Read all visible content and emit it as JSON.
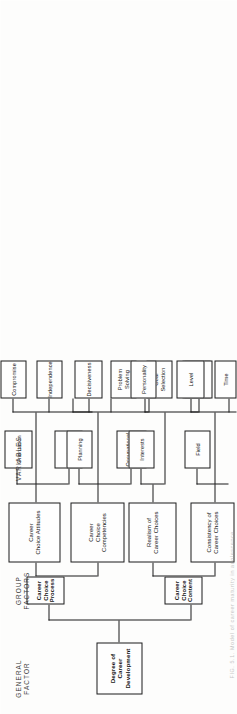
{
  "figure": {
    "type": "hierarchy-tree",
    "orientation": "rotated-90-ccw",
    "caption_fragment": "FIG. 5.1.  Model of career maturity in adolescence",
    "row_labels": [
      {
        "id": "general-factor",
        "text": "GENERAL\nFACTOR"
      },
      {
        "id": "group-factors",
        "text": "GROUP\nFACTORS"
      },
      {
        "id": "variables",
        "text": "VARIABLES"
      }
    ],
    "colors": {
      "box_border": "#1b1b1b",
      "box_fill": "#fefefe",
      "text": "#141414",
      "label_text": "#3a3a3a",
      "page_background": "#fdfdfc"
    },
    "levels": {
      "root": {
        "label": "Degree of Career Development",
        "bold": true
      },
      "group_factors": [
        {
          "id": "career-choice-attitudes",
          "label": "Career\nChoice Attitudes",
          "bold": false
        },
        {
          "id": "career-choice-process",
          "label": "Career\nChoice\nProcess",
          "bold": true
        },
        {
          "id": "career-choice-competencies",
          "label": "Career\nChoice Competencies",
          "bold": false
        },
        {
          "id": "realism-of-career-choices",
          "label": "Realism of\nCareer Choices",
          "bold": false
        },
        {
          "id": "career-choice-content",
          "label": "Career\nChoice\nContent",
          "bold": true
        },
        {
          "id": "consistency-of-career-choices",
          "label": "Consistency of\nCareer Choices",
          "bold": false
        }
      ],
      "sub_groups": [
        {
          "id": "orientation",
          "label": "Orientation",
          "parent": "career-choice-attitudes"
        },
        {
          "id": "involvement",
          "label": "Involvement",
          "parent": "career-choice-attitudes"
        },
        {
          "id": "planning",
          "label": "Planning",
          "parent": "career-choice-competencies"
        },
        {
          "id": "occupational-information",
          "label": "Occupational\nInformation",
          "parent": "career-choice-competencies"
        },
        {
          "id": "interests",
          "label": "Interests",
          "parent": "realism-of-career-choices"
        },
        {
          "id": "field",
          "label": "Field",
          "parent": "consistency-of-career-choices"
        }
      ],
      "variables": [
        {
          "id": "compromise",
          "label": "Compromise",
          "parent": "career-choice-attitudes"
        },
        {
          "id": "independence",
          "label": "Independence",
          "parent": "career-choice-attitudes"
        },
        {
          "id": "decisiveness",
          "label": "Decisiveness",
          "parent": "career-choice-attitudes"
        },
        {
          "id": "problem-solving",
          "label": "Problem\nSolving",
          "parent": "career-choice-competencies"
        },
        {
          "id": "goal-selection",
          "label": "Goal\nSelection",
          "parent": "career-choice-competencies"
        },
        {
          "id": "self-appraisal",
          "label": "Self\nAppraisal",
          "parent": "career-choice-competencies"
        },
        {
          "id": "personality",
          "label": "Personality",
          "parent": "realism-of-career-choices"
        },
        {
          "id": "abilities",
          "label": "Abilities",
          "parent": "realism-of-career-choices"
        },
        {
          "id": "level",
          "label": "Level",
          "parent": "consistency-of-career-choices"
        },
        {
          "id": "time",
          "label": "Time",
          "parent": "consistency-of-career-choices"
        }
      ]
    }
  }
}
